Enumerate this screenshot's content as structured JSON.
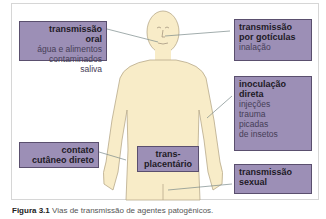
{
  "diagram": {
    "colors": {
      "box_fill": "#9c8fb6",
      "box_border": "#5a4f6e",
      "body_fill": "#f8ecc8",
      "body_outline": "#b8a98a",
      "line": "#7a8a8a"
    },
    "labels": [
      {
        "id": "oral",
        "title": "transmissão oral",
        "title_lines": [
          "transmissão",
          "oral"
        ],
        "details": [
          "água e alimentos",
          "contaminados",
          "saliva"
        ]
      },
      {
        "id": "droplets",
        "title_lines": [
          "transmissão",
          "por gotículas"
        ],
        "details": [
          "inalação"
        ]
      },
      {
        "id": "inoculation",
        "title_lines": [
          "inoculação",
          "direta"
        ],
        "details": [
          "injeções",
          "trauma",
          "picadas",
          "de insetos"
        ]
      },
      {
        "id": "skin",
        "title_lines": [
          "contato",
          "cutâneo direto"
        ],
        "details": []
      },
      {
        "id": "transplacental",
        "title_lines": [
          "trans-",
          "placentário"
        ],
        "details": []
      },
      {
        "id": "sexual",
        "title_lines": [
          "transmissão",
          "sexual"
        ],
        "details": []
      }
    ],
    "caption": {
      "label": "Figura 3.1",
      "text": "Vias de transmissão de agentes patogênicos."
    }
  }
}
